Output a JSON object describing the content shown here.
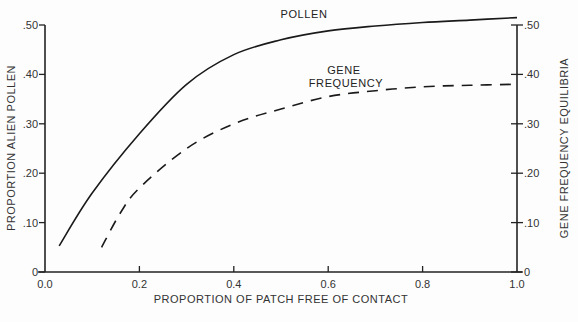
{
  "chart_data": {
    "type": "line",
    "title": "",
    "xlabel": "PROPORTION OF PATCH FREE OF CONTACT",
    "ylabel": "PROPORTION ALIEN POLLEN",
    "ylabel_right": "GENE FREQUENCY EQUILIBRIA",
    "xlim": [
      0.0,
      1.0
    ],
    "ylim": [
      0,
      0.5
    ],
    "ylim_right": [
      0,
      0.5
    ],
    "x_ticks": [
      "0.0",
      "0.2",
      "0.4",
      "0.6",
      "0.8",
      "1.0"
    ],
    "y_ticks_left": [
      "0",
      ".10",
      ".20",
      ".30",
      ".40",
      ".50"
    ],
    "y_ticks_right": [
      "0",
      ".10",
      ".20",
      ".30",
      ".40",
      ".50"
    ],
    "grid": false,
    "series": [
      {
        "name": "POLLEN",
        "style": "solid",
        "axis": "left",
        "x": [
          0.03,
          0.1,
          0.2,
          0.3,
          0.4,
          0.5,
          0.6,
          0.7,
          0.8,
          0.9,
          1.0
        ],
        "y": [
          0.053,
          0.16,
          0.28,
          0.38,
          0.44,
          0.47,
          0.488,
          0.498,
          0.505,
          0.51,
          0.515
        ]
      },
      {
        "name": "GENE FREQUENCY",
        "style": "dashed",
        "axis": "right",
        "x": [
          0.12,
          0.16,
          0.2,
          0.3,
          0.4,
          0.5,
          0.6,
          0.7,
          0.8,
          0.9,
          1.0
        ],
        "y": [
          0.05,
          0.12,
          0.17,
          0.25,
          0.3,
          0.33,
          0.355,
          0.367,
          0.375,
          0.378,
          0.38
        ]
      }
    ],
    "annotations": [
      "POLLEN",
      "GENE FREQUENCY"
    ]
  }
}
